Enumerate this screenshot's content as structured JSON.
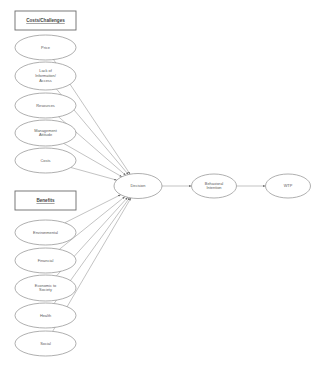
{
  "diagram": {
    "background_color": "#ffffff",
    "node_stroke_color": "#8d8d8d",
    "edge_color": "#9a9a9a",
    "label_color": "#5a5a5a",
    "groups": [
      {
        "id": "costs",
        "label": "Costs/Challenges",
        "x": 15,
        "y": 11,
        "w": 61,
        "h": 19
      },
      {
        "id": "benefits",
        "label": "Benefits",
        "x": 15,
        "y": 191,
        "w": 61,
        "h": 19
      }
    ],
    "nodes": [
      {
        "id": "price",
        "label": "Price",
        "lines": [
          "Price"
        ],
        "cx": 45.5,
        "cy": 47.5,
        "rx": 30.5,
        "ry": 12.5,
        "group": "costs"
      },
      {
        "id": "lack-info",
        "label": "Lack of Information/ Access",
        "lines": [
          "Lack of",
          "Information/",
          "Access"
        ],
        "cx": 45.5,
        "cy": 76,
        "rx": 30.5,
        "ry": 14,
        "group": "costs"
      },
      {
        "id": "resources",
        "label": "Resources",
        "lines": [
          "Resources"
        ],
        "cx": 45.5,
        "cy": 105.5,
        "rx": 30.5,
        "ry": 12.5,
        "group": "costs"
      },
      {
        "id": "mgmt-attitude",
        "label": "Management Attitude",
        "lines": [
          "Management",
          "Attitude"
        ],
        "cx": 45.5,
        "cy": 133,
        "rx": 30.5,
        "ry": 13,
        "group": "costs"
      },
      {
        "id": "costs-node",
        "label": "Costs",
        "lines": [
          "Costs"
        ],
        "cx": 45.5,
        "cy": 160.5,
        "rx": 30.5,
        "ry": 12.5,
        "group": "costs"
      },
      {
        "id": "environmental",
        "label": "Environmental",
        "lines": [
          "Environmental"
        ],
        "cx": 45.5,
        "cy": 232.5,
        "rx": 30.5,
        "ry": 12.5,
        "group": "benefits"
      },
      {
        "id": "financial",
        "label": "Financial",
        "lines": [
          "Financial"
        ],
        "cx": 45.5,
        "cy": 260.5,
        "rx": 30.5,
        "ry": 12.5,
        "group": "benefits"
      },
      {
        "id": "economic",
        "label": "Economic to Society",
        "lines": [
          "Economic to",
          "Society"
        ],
        "cx": 45.5,
        "cy": 288,
        "rx": 30.5,
        "ry": 13,
        "group": "benefits"
      },
      {
        "id": "health",
        "label": "Health",
        "lines": [
          "Health"
        ],
        "cx": 45.5,
        "cy": 315.5,
        "rx": 30.5,
        "ry": 12.5,
        "group": "benefits"
      },
      {
        "id": "social",
        "label": "Social",
        "lines": [
          "Social"
        ],
        "cx": 45.5,
        "cy": 343.5,
        "rx": 30.5,
        "ry": 12.5,
        "group": "benefits"
      },
      {
        "id": "decision",
        "label": "Decision",
        "lines": [
          "Decision"
        ],
        "cx": 138,
        "cy": 186,
        "rx": 24,
        "ry": 12.5,
        "group": "core"
      },
      {
        "id": "behavioral",
        "label": "Behavioral Intention",
        "lines": [
          "Behavioral",
          "Intention"
        ],
        "cx": 214,
        "cy": 186,
        "rx": 22.5,
        "ry": 12,
        "group": "core"
      },
      {
        "id": "wtp",
        "label": "WTP",
        "lines": [
          "WTP"
        ],
        "cx": 288,
        "cy": 186,
        "rx": 22.5,
        "ry": 12,
        "group": "core"
      }
    ],
    "edges": [
      {
        "from": "price",
        "to": "decision",
        "arrow": true
      },
      {
        "from": "lack-info",
        "to": "decision",
        "arrow": true
      },
      {
        "from": "resources",
        "to": "decision",
        "arrow": true
      },
      {
        "from": "mgmt-attitude",
        "to": "decision",
        "arrow": true
      },
      {
        "from": "costs-node",
        "to": "decision",
        "arrow": true
      },
      {
        "from": "environmental",
        "to": "decision",
        "arrow": true
      },
      {
        "from": "financial",
        "to": "decision",
        "arrow": true
      },
      {
        "from": "economic",
        "to": "decision",
        "arrow": true
      },
      {
        "from": "health",
        "to": "decision",
        "arrow": true
      },
      {
        "from": "social",
        "to": "decision",
        "arrow": true
      },
      {
        "from": "decision",
        "to": "behavioral",
        "arrow": true
      },
      {
        "from": "behavioral",
        "to": "wtp",
        "arrow": true
      }
    ]
  }
}
